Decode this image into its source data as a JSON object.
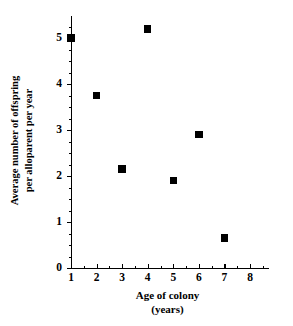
{
  "chart_data": {
    "type": "scatter",
    "title": "",
    "xlabel": "Age of colony (years)",
    "ylabel": "Average number of offspring per alloparent per year",
    "xlim": [
      0.6,
      8.6
    ],
    "ylim": [
      0,
      5.5
    ],
    "grid": false,
    "legend": "none",
    "marker": "filled-square",
    "marker_color": "#000000",
    "x": [
      1,
      2,
      3,
      4,
      5,
      6,
      7
    ],
    "values": [
      5.0,
      3.75,
      2.15,
      5.2,
      1.9,
      2.9,
      0.65
    ],
    "points": [
      {
        "x": 1,
        "y": 5.0
      },
      {
        "x": 2,
        "y": 3.75
      },
      {
        "x": 3,
        "y": 2.15
      },
      {
        "x": 4,
        "y": 5.2
      },
      {
        "x": 5,
        "y": 1.9
      },
      {
        "x": 6,
        "y": 2.9
      },
      {
        "x": 7,
        "y": 0.65
      }
    ],
    "xticks": [
      1,
      2,
      3,
      4,
      5,
      6,
      7,
      8
    ],
    "yticks": [
      0,
      1,
      2,
      3,
      4,
      5
    ],
    "x_minor_tick_interval": 0.5,
    "y_minor_tick_interval": 0.25
  },
  "axes": {
    "y_title_line1": "Average number of offspring",
    "y_title_line2": "per alloparent per year",
    "x_title_line1": "Age of colony",
    "x_title_line2": "(years)",
    "y_tick_labels": [
      "5",
      "4",
      "3",
      "2",
      "1",
      "0"
    ],
    "x_tick_labels": [
      "1",
      "2",
      "3",
      "4",
      "5",
      "6",
      "7",
      "8"
    ]
  },
  "style": {
    "axis_color": "#000000",
    "marker_color": "#000000",
    "background": "#ffffff"
  }
}
